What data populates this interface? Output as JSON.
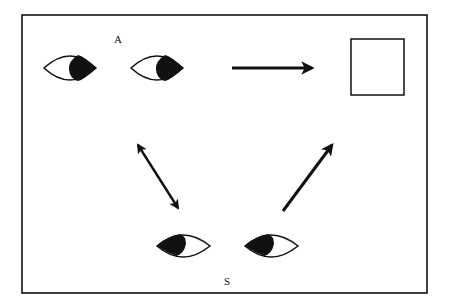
{
  "diagram": {
    "type": "gaze-following illustration",
    "frame": {
      "x": 22,
      "y": 15,
      "width": 405,
      "height": 278,
      "stroke": "#111111"
    },
    "labels": {
      "agent": "A",
      "subject": "S"
    },
    "agent_eyes": {
      "gaze_direction": "right",
      "eyes": [
        {
          "cx": 70,
          "cy": 68,
          "rx": 26,
          "ry": 13
        },
        {
          "cx": 157,
          "cy": 68,
          "rx": 26,
          "ry": 13
        }
      ]
    },
    "subject_eyes": {
      "gaze_direction": "up-left",
      "eyes": [
        {
          "cx": 183,
          "cy": 245,
          "rx": 26,
          "ry": 12
        },
        {
          "cx": 271,
          "cy": 245,
          "rx": 26,
          "ry": 12
        }
      ]
    },
    "target_object": {
      "shape": "square",
      "x": 351,
      "y": 39,
      "width": 53,
      "height": 56
    },
    "arrows": [
      {
        "name": "agent-to-object",
        "x1": 232,
        "y1": 68,
        "x2": 312,
        "y2": 68,
        "heads": "end"
      },
      {
        "name": "agent-subject-mutual",
        "x1": 138,
        "y1": 145,
        "x2": 178,
        "y2": 208,
        "heads": "both"
      },
      {
        "name": "subject-to-object",
        "x1": 283,
        "y1": 211,
        "x2": 332,
        "y2": 145,
        "heads": "end"
      }
    ],
    "colors": {
      "ink": "#111111",
      "paper": "#ffffff"
    }
  }
}
